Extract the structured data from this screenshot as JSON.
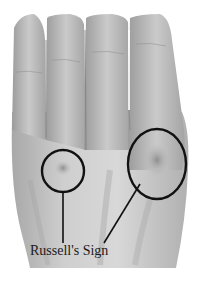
{
  "image": {
    "subject": "dorsal view of a hand with knuckle calluses",
    "annotation_label": "Russell's Sign",
    "colors": {
      "background": "#ffffff",
      "skin_light": "#d6d6d6",
      "skin_mid": "#b4b4b4",
      "skin_dark": "#8a8a8a",
      "annotation_stroke": "#111111"
    },
    "markers": [
      {
        "name": "small-circle",
        "cx": 63,
        "cy": 171,
        "rx": 21,
        "ry": 21
      },
      {
        "name": "large-circle",
        "cx": 157,
        "cy": 164,
        "rx": 29,
        "ry": 35
      }
    ]
  }
}
